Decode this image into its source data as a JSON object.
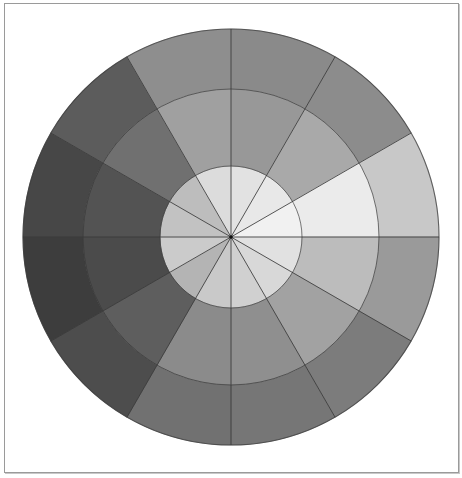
{
  "diagram": {
    "type": "grayscale-value-wheel",
    "center": {
      "x": 231,
      "y": 237
    },
    "radii": {
      "outer": 208,
      "middle": 148,
      "inner": 71
    },
    "sector_count": 12,
    "sector_angle_deg": 30,
    "start_angle_deg_from_top": 0,
    "direction": "clockwise",
    "line_color": "#3a3a3a",
    "frame_color": "#9a9a9a",
    "sectors": [
      {
        "index": 0,
        "outer": "#8a8a8a",
        "middle": "#989898",
        "inner": "#e2e2e2"
      },
      {
        "index": 1,
        "outer": "#8c8c8c",
        "middle": "#a9a9a9",
        "inner": "#e8e8e8"
      },
      {
        "index": 2,
        "outer": "#c8c8c8",
        "middle": "#ebebeb",
        "inner": "#f1f1f1"
      },
      {
        "index": 3,
        "outer": "#9a9a9a",
        "middle": "#bcbcbc",
        "inner": "#e1e1e1"
      },
      {
        "index": 4,
        "outer": "#7c7c7c",
        "middle": "#a2a2a2",
        "inner": "#d8d8d8"
      },
      {
        "index": 5,
        "outer": "#767676",
        "middle": "#8f8f8f",
        "inner": "#d0d0d0"
      },
      {
        "index": 6,
        "outer": "#717171",
        "middle": "#8b8b8b",
        "inner": "#c9c9c9"
      },
      {
        "index": 7,
        "outer": "#4d4d4d",
        "middle": "#5e5e5e",
        "inner": "#b4b4b4"
      },
      {
        "index": 8,
        "outer": "#3d3d3d",
        "middle": "#4b4b4b",
        "inner": "#cbcbcb"
      },
      {
        "index": 9,
        "outer": "#474747",
        "middle": "#535353",
        "inner": "#c2c2c2"
      },
      {
        "index": 10,
        "outer": "#5c5c5c",
        "middle": "#707070",
        "inner": "#bdbdbd"
      },
      {
        "index": 11,
        "outer": "#8e8e8e",
        "middle": "#a0a0a0",
        "inner": "#dcdcdc"
      }
    ]
  }
}
